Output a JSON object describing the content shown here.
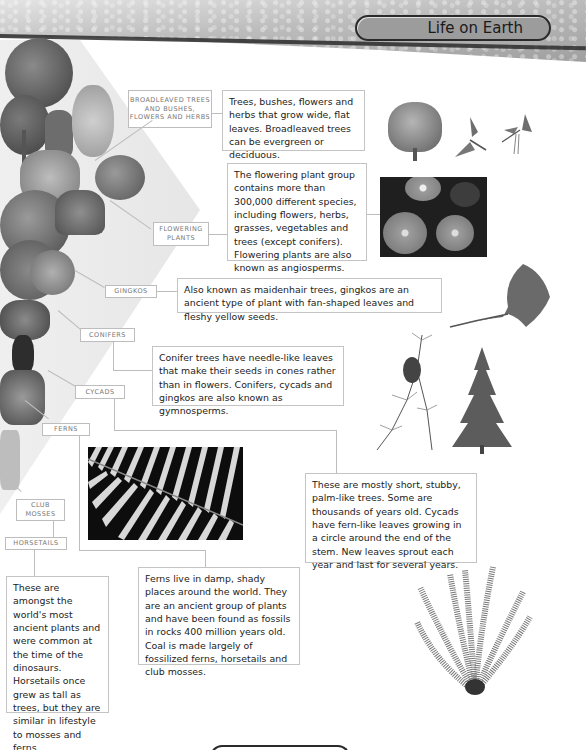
{
  "header": {
    "title": "Life on Earth"
  },
  "labels": {
    "broadleaved": "BROADLEAVED TREES AND BUSHES, FLOWERS AND HERBS",
    "flowering": "FLOWERING PLANTS",
    "gingkos": "GINGKOS",
    "conifers": "CONIFERS",
    "cycads": "CYCADS",
    "ferns": "FERNS",
    "club_mosses": "CLUB MOSSES",
    "horsetails": "HORSETAILS"
  },
  "descriptions": {
    "broadleaved": "Trees, bushes, flowers and herbs that grow wide, flat leaves. Broadleaved trees can be evergreen or deciduous.",
    "flowering": "The flowering plant group contains more than 300,000 different species, including flowers, herbs, grasses, vegetables and trees (except conifers). Flowering plants are also known as angiosperms.",
    "gingkos": "Also known as maidenhair trees, gingkos are an ancient type of plant with fan-shaped leaves and fleshy yellow seeds.",
    "conifers": "Conifer trees have needle-like leaves that make their seeds in cones rather than in flowers. Conifers, cycads and gingkos are also known as gymnosperms.",
    "cycads": "These are mostly short, stubby, palm-like trees. Some are thousands of years old. Cycads have fern-like leaves growing in a circle around the end of the stem. New leaves sprout each year and last for several years.",
    "ferns": "Ferns live in damp, shady places around the world. They are an ancient group of plants and have been found as fossils in rocks 400 million years old. Coal is made largely of fossilized ferns, horsetails and club mosses.",
    "horsetails": "These are amongst the world's most ancient plants and were common at the time of the dinosaurs. Horsetails once grew as tall as trees, but they are similar in lifestyle to mosses and ferns."
  },
  "illustrations": {
    "broadleaf_tree": "broadleaf-tree-illustration",
    "leaf_sprig_1": "leaf-sprig-illustration",
    "leaf_sprig_2": "leaf-catkin-illustration",
    "flowers_photo": "gerbera-flowers-photo",
    "gingko_leaf": "gingko-leaf-illustration",
    "larch_branch": "larch-branch-illustration",
    "fir_tree": "fir-tree-illustration",
    "fern_photo": "fern-frond-photo",
    "cycad_plant": "cycad-plant-illustration"
  },
  "colors": {
    "header_pill": "#9c9c9c",
    "border": "#c4c4c4",
    "text": "#222222",
    "label_text": "#777777"
  }
}
